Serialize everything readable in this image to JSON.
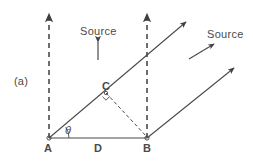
{
  "figure": {
    "panel_label": "(a)",
    "colors": {
      "background": "#ffffff",
      "stroke": "#4a4a4a",
      "text": "#4a4a4a"
    },
    "labels": {
      "source_top": "Source",
      "source_right": "Source",
      "point_a": "A",
      "point_b": "B",
      "point_c": "C",
      "baseline": "D",
      "angle": "θ"
    },
    "geometry": {
      "point_a": {
        "x": 49,
        "y": 138
      },
      "point_b": {
        "x": 147,
        "y": 138
      },
      "point_c": {
        "x": 106,
        "y": 93
      },
      "baseline_length_label": "D",
      "angle_label": "θ",
      "vertical_dashed_lines": [
        {
          "x": 49,
          "y_top": 10,
          "y_bottom": 138,
          "arrow": "up"
        },
        {
          "x": 147,
          "y_top": 10,
          "y_bottom": 138,
          "arrow": "up"
        }
      ],
      "rays": [
        {
          "from": "A",
          "x1": 49,
          "y1": 138,
          "x2": 189,
          "y2": 20,
          "arrow": "up-right"
        },
        {
          "from": "B",
          "x1": 147,
          "y1": 138,
          "x2": 237,
          "y2": 66,
          "arrow": "up-right"
        }
      ],
      "perpendicular_dashed": {
        "x1": 106,
        "y1": 93,
        "x2": 147,
        "y2": 138,
        "right_angle_at": "C"
      },
      "source_arrow_top": {
        "x": 98,
        "y1": 58,
        "y2": 42,
        "direction": "up"
      },
      "source_arrow_right": {
        "x1": 190,
        "y1": 58,
        "x2": 214,
        "y2": 44,
        "direction": "up-right"
      }
    }
  }
}
